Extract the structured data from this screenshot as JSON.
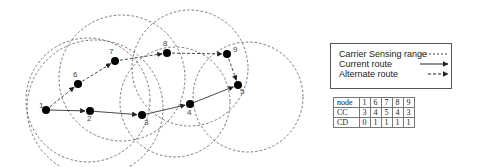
{
  "diagram": {
    "nodes": [
      {
        "id": "1",
        "label": "1"
      },
      {
        "id": "2",
        "label": "2"
      },
      {
        "id": "3",
        "label": "3"
      },
      {
        "id": "4",
        "label": "4"
      },
      {
        "id": "5",
        "label": "5"
      },
      {
        "id": "6",
        "label": "6"
      },
      {
        "id": "7",
        "label": "7"
      },
      {
        "id": "8",
        "label": "8"
      },
      {
        "id": "9",
        "label": "9"
      }
    ],
    "current_route": [
      "1",
      "2",
      "3",
      "4",
      "5"
    ],
    "alternate_route": [
      "1",
      "6",
      "7",
      "8",
      "9",
      "5"
    ],
    "sensing_ranges_around": [
      "1",
      "6",
      "8",
      "9",
      "3"
    ],
    "colors": {
      "node": "#000000",
      "line": "#333333",
      "range": "#555555"
    }
  },
  "legend": {
    "carrier_sensing": "Carrier Sensing range",
    "current_route": "Current route",
    "alternate_route": "Alternate route"
  },
  "table": {
    "header_label": "node",
    "header": [
      "1",
      "6",
      "7",
      "8",
      "9"
    ],
    "rows": [
      {
        "label": "CC",
        "values": [
          "3",
          "4",
          "5",
          "4",
          "3"
        ]
      },
      {
        "label": "CD",
        "values": [
          "0",
          "1",
          "1",
          "1",
          "1"
        ]
      }
    ]
  }
}
